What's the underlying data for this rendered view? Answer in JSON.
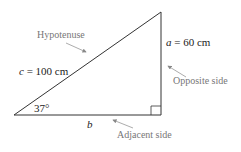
{
  "diagram": {
    "type": "right-triangle",
    "angle_label": "37°",
    "hypotenuse": {
      "var": "c",
      "value": "= 100 cm",
      "caption": "Hypotenuse"
    },
    "opposite": {
      "var": "a",
      "value": "= 60 cm",
      "caption": "Opposite side"
    },
    "adjacent": {
      "var": "b",
      "caption": "Adjacent side"
    },
    "colors": {
      "line": "#333333",
      "caption": "#777777",
      "arrow": "#888888"
    }
  }
}
